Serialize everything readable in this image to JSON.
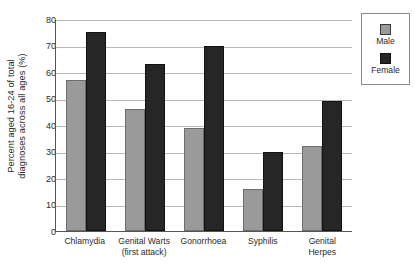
{
  "chart_data": {
    "type": "bar",
    "title": "",
    "xlabel": "",
    "ylabel": "Percent aged 16-24 of total diagnoses across all ages (%)",
    "ylabel_line1": "Percent aged 16-24 of total",
    "ylabel_line2": "diagnoses across all ages (%)",
    "categories": [
      "Chlamydia",
      "Genital Warts (first attack)",
      "Gonorrhoea",
      "Syphilis",
      "Genital Herpes"
    ],
    "category_lines": [
      [
        "Chlamydia"
      ],
      [
        "Genital Warts",
        "(first attack)"
      ],
      [
        "Gonorrhoea"
      ],
      [
        "Syphilis"
      ],
      [
        "Genital",
        "Herpes"
      ]
    ],
    "series": [
      {
        "name": "Male",
        "color": "#9a9a9a",
        "values": [
          57,
          46,
          39,
          16,
          32
        ]
      },
      {
        "name": "Female",
        "color": "#262626",
        "values": [
          75,
          63,
          70,
          30,
          49
        ]
      }
    ],
    "ylim": [
      0,
      80
    ],
    "yticks": [
      80,
      70,
      60,
      50,
      40,
      30,
      20,
      10,
      0
    ],
    "grid": true,
    "legend_position": "right"
  },
  "legend": {
    "items": [
      {
        "label": "Male"
      },
      {
        "label": "Female"
      }
    ]
  }
}
